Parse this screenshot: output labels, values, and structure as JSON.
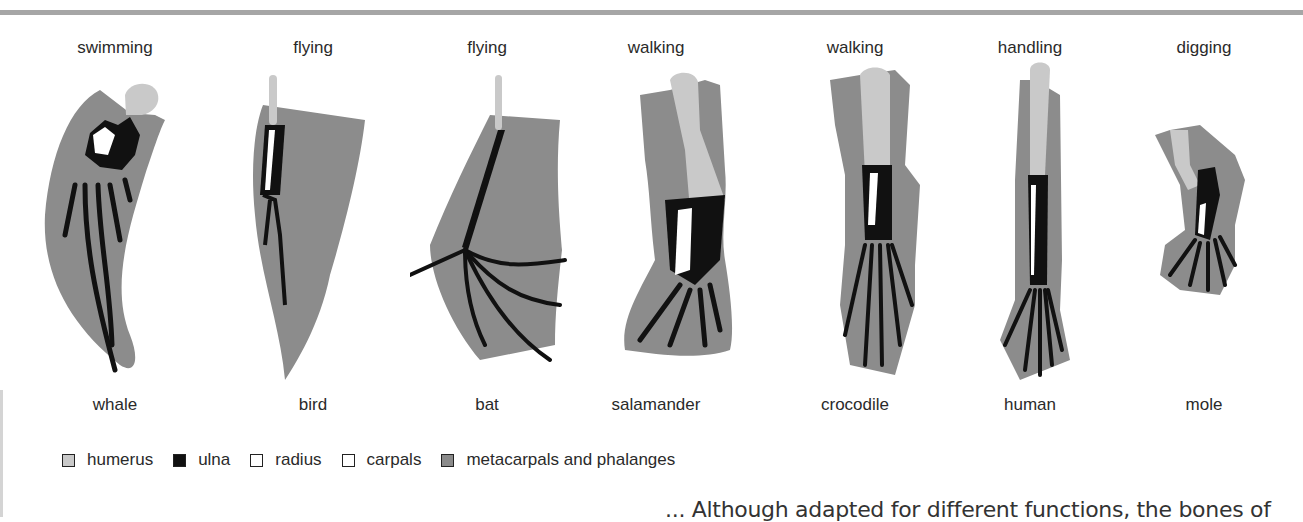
{
  "figure": {
    "columns": [
      {
        "function": "swimming",
        "animal": "whale",
        "x": 115
      },
      {
        "function": "flying",
        "animal": "bird",
        "x": 313
      },
      {
        "function": "flying",
        "animal": "bat",
        "x": 487
      },
      {
        "function": "walking",
        "animal": "salamander",
        "x": 656
      },
      {
        "function": "walking",
        "animal": "crocodile",
        "x": 855
      },
      {
        "function": "handling",
        "animal": "human",
        "x": 1030
      },
      {
        "function": "digging",
        "animal": "mole",
        "x": 1204
      }
    ]
  },
  "legend": {
    "items": [
      {
        "label": "humerus",
        "color": "#c9c9c9"
      },
      {
        "label": "ulna",
        "color": "#111111"
      },
      {
        "label": "radius",
        "color": "#ffffff"
      },
      {
        "label": "carpals",
        "color": "#ffffff"
      },
      {
        "label": "metacarpals and phalanges",
        "color": "#8a8a8a"
      }
    ]
  },
  "colors": {
    "soft_tissue": "#8c8c8c",
    "humerus": "#c9c9c9",
    "ulna": "#111111",
    "radius": "#ffffff"
  },
  "caption": {
    "text": "... Although adapted for different functions, the bones of"
  }
}
